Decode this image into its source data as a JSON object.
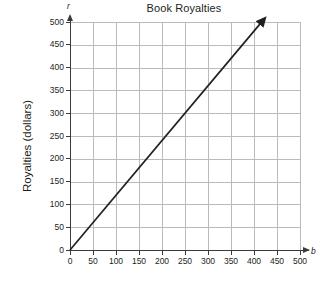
{
  "chart_data": {
    "type": "line",
    "title": "Book Royalties",
    "xlabel": "b",
    "ylabel": "Royalties (dollars)",
    "x_axis_variable": "b",
    "y_axis_variable": "r",
    "xlim": [
      0,
      500
    ],
    "ylim": [
      0,
      500
    ],
    "x_ticks": [
      0,
      50,
      100,
      150,
      200,
      250,
      300,
      350,
      400,
      450,
      500
    ],
    "y_ticks": [
      0,
      50,
      100,
      150,
      200,
      250,
      300,
      350,
      400,
      450,
      500
    ],
    "x_tick_labels": [
      "0",
      "50",
      "100",
      "150",
      "200",
      "250",
      "300",
      "350",
      "400",
      "450",
      "500"
    ],
    "y_tick_labels": [
      "0",
      "50",
      "100",
      "150",
      "200",
      "250",
      "300",
      "350",
      "400",
      "450",
      "500"
    ],
    "grid": true,
    "grid_color": "#b9bbbd",
    "legend": null,
    "series": [
      {
        "name": "royalties",
        "slope": 1.2,
        "intercept": 0,
        "arrow_end": true,
        "color": "#231f20",
        "x": [
          0,
          50,
          100,
          150,
          200,
          250,
          300,
          350,
          400,
          415
        ],
        "values": [
          0,
          60,
          120,
          180,
          240,
          300,
          360,
          420,
          480,
          498
        ]
      }
    ]
  },
  "figure": {
    "title": "Book Royalties",
    "y_axis_title": "Royalties (dollars)",
    "x_axis_variable": "b",
    "y_axis_variable": "r",
    "background": "#ffffff",
    "axis_color": "#3a3a3a",
    "line_color": "#231f20"
  }
}
